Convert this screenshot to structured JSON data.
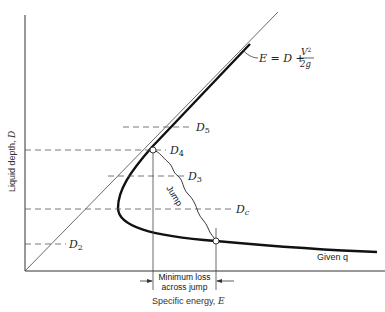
{
  "diagram": {
    "axes": {
      "y_label_text": "Liquid depth, ",
      "y_label_var": "D",
      "x_label_text": "Specific energy, ",
      "x_label_var": "E"
    },
    "equation": {
      "lhs": "E = D +",
      "numerator": "V",
      "exponent": "2",
      "denominator": "2g"
    },
    "curve_label": "Given q",
    "jump_label": "Jump",
    "min_loss_label_line1": "Minimum loss",
    "min_loss_label_line2": "across jump",
    "depth_labels": {
      "d5": {
        "base": "D",
        "sub": "5"
      },
      "d4": {
        "base": "D",
        "sub": "4"
      },
      "d3": {
        "base": "D",
        "sub": "3"
      },
      "dc": {
        "base": "D",
        "sub": "c"
      },
      "d2": {
        "base": "D",
        "sub": "2"
      }
    },
    "colors": {
      "line": "#1a1a1a",
      "dash": "#555555",
      "background": "#ffffff"
    }
  }
}
